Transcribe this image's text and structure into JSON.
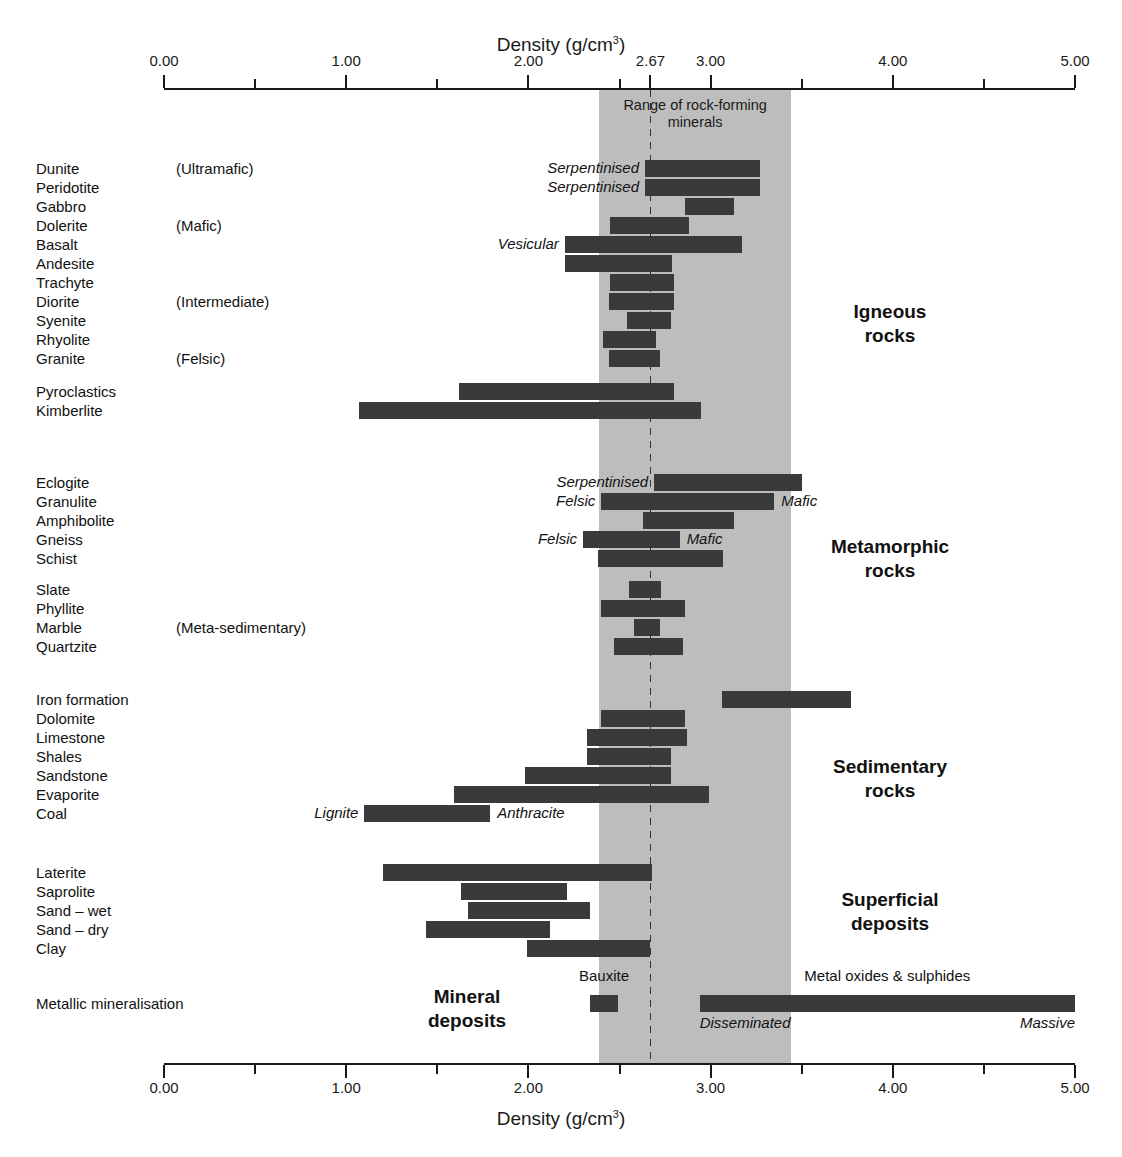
{
  "chart_data": {
    "type": "bar",
    "orientation": "horizontal-range",
    "title": "Density (g/cm3)",
    "xlabel": "Density (g/cm³)",
    "xlabel_top": "Density (g/cm³)",
    "xlabel_bottom": "Density (g/cm³)",
    "ylabel": "",
    "xlim": [
      0.0,
      5.0
    ],
    "xticks": [
      0.0,
      1.0,
      2.0,
      3.0,
      4.0,
      5.0
    ],
    "xticklabels": [
      "0.00",
      "1.00",
      "2.00",
      "3.00",
      "4.00",
      "5.00"
    ],
    "xticks_minor": [
      0.5,
      1.5,
      2.5,
      3.5,
      4.5
    ],
    "special_tick": {
      "value": 2.67,
      "label": "2.67"
    },
    "grid": false,
    "legend": false,
    "band": {
      "label": "Range of rock-forming\nminerals",
      "min": 2.39,
      "max": 3.44,
      "color": "#bdbdbd",
      "reference_line": 2.67
    },
    "categories": [
      "Dunite",
      "Peridotite",
      "Gabbro",
      "Dolerite",
      "Basalt",
      "Andesite",
      "Trachyte",
      "Diorite",
      "Syenite",
      "Rhyolite",
      "Granite",
      "Pyroclastics",
      "Kimberlite",
      "Eclogite",
      "Granulite",
      "Amphibolite",
      "Gneiss",
      "Schist",
      "Slate",
      "Phyllite",
      "Marble",
      "Quartzite",
      "Iron formation",
      "Dolomite",
      "Limestone",
      "Shales",
      "Sandstone",
      "Evaporite",
      "Coal",
      "Laterite",
      "Saprolite",
      "Sand – wet",
      "Sand – dry",
      "Clay",
      "Metallic mineralisation"
    ],
    "ranges": [
      [
        2.64,
        3.27
      ],
      [
        2.64,
        3.27
      ],
      [
        2.86,
        3.13
      ],
      [
        2.45,
        2.88
      ],
      [
        2.2,
        3.17
      ],
      [
        2.2,
        2.79
      ],
      [
        2.45,
        2.8
      ],
      [
        2.44,
        2.8
      ],
      [
        2.54,
        2.78
      ],
      [
        2.41,
        2.7
      ],
      [
        2.44,
        2.72
      ],
      [
        1.62,
        2.8
      ],
      [
        1.07,
        2.95
      ],
      [
        2.69,
        3.5
      ],
      [
        2.4,
        3.35
      ],
      [
        2.63,
        3.13
      ],
      [
        2.3,
        2.83
      ],
      [
        2.38,
        3.07
      ],
      [
        2.55,
        2.73
      ],
      [
        2.4,
        2.86
      ],
      [
        2.58,
        2.72
      ],
      [
        2.47,
        2.85
      ],
      [
        3.06,
        3.77
      ],
      [
        2.4,
        2.86
      ],
      [
        2.32,
        2.87
      ],
      [
        2.32,
        2.78
      ],
      [
        1.98,
        2.78
      ],
      [
        1.59,
        2.99
      ],
      [
        1.1,
        1.79
      ],
      [
        1.2,
        2.68
      ],
      [
        1.63,
        2.21
      ],
      [
        1.67,
        2.34
      ],
      [
        1.44,
        2.12
      ],
      [
        1.99,
        2.67
      ],
      [
        2.34,
        2.49
      ]
    ],
    "extra_ranges": [
      {
        "category": "Metallic mineralisation",
        "label": "Metal oxides & sulphides",
        "min": 2.94,
        "max": 5.0
      }
    ]
  },
  "rows": [
    {
      "name": "Dunite",
      "label": "Dunite",
      "group": "(Ultramafic)",
      "min": 2.64,
      "max": 3.27,
      "left_annot": "Serpentinised",
      "right_annot": ""
    },
    {
      "name": "Peridotite",
      "label": "Peridotite",
      "group": "",
      "min": 2.64,
      "max": 3.27,
      "left_annot": "Serpentinised",
      "right_annot": ""
    },
    {
      "name": "Gabbro",
      "label": "Gabbro",
      "group": "",
      "min": 2.86,
      "max": 3.13,
      "left_annot": "",
      "right_annot": ""
    },
    {
      "name": "Dolerite",
      "label": "Dolerite",
      "group": "(Mafic)",
      "min": 2.45,
      "max": 2.88,
      "left_annot": "",
      "right_annot": ""
    },
    {
      "name": "Basalt",
      "label": "Basalt",
      "group": "",
      "min": 2.2,
      "max": 3.17,
      "left_annot": "Vesicular",
      "right_annot": ""
    },
    {
      "name": "Andesite",
      "label": "Andesite",
      "group": "",
      "min": 2.2,
      "max": 2.79,
      "left_annot": "",
      "right_annot": ""
    },
    {
      "name": "Trachyte",
      "label": "Trachyte",
      "group": "",
      "min": 2.45,
      "max": 2.8,
      "left_annot": "",
      "right_annot": ""
    },
    {
      "name": "Diorite",
      "label": "Diorite",
      "group": "(Intermediate)",
      "min": 2.44,
      "max": 2.8,
      "left_annot": "",
      "right_annot": ""
    },
    {
      "name": "Syenite",
      "label": "Syenite",
      "group": "",
      "min": 2.54,
      "max": 2.78,
      "left_annot": "",
      "right_annot": ""
    },
    {
      "name": "Rhyolite",
      "label": "Rhyolite",
      "group": "",
      "min": 2.41,
      "max": 2.7,
      "left_annot": "",
      "right_annot": ""
    },
    {
      "name": "Granite",
      "label": "Granite",
      "group": "(Felsic)",
      "min": 2.44,
      "max": 2.72,
      "left_annot": "",
      "right_annot": ""
    },
    {
      "name": "Pyroclastics",
      "label": "Pyroclastics",
      "group": "",
      "min": 1.62,
      "max": 2.8,
      "left_annot": "",
      "right_annot": ""
    },
    {
      "name": "Kimberlite",
      "label": "Kimberlite",
      "group": "",
      "min": 1.07,
      "max": 2.95,
      "left_annot": "",
      "right_annot": ""
    },
    {
      "name": "Eclogite",
      "label": "Eclogite",
      "group": "",
      "min": 2.69,
      "max": 3.5,
      "left_annot": "Serpentinised",
      "right_annot": ""
    },
    {
      "name": "Granulite",
      "label": "Granulite",
      "group": "",
      "min": 2.4,
      "max": 3.35,
      "left_annot": "Felsic",
      "right_annot": "Mafic"
    },
    {
      "name": "Amphibolite",
      "label": "Amphibolite",
      "group": "",
      "min": 2.63,
      "max": 3.13,
      "left_annot": "",
      "right_annot": ""
    },
    {
      "name": "Gneiss",
      "label": "Gneiss",
      "group": "",
      "min": 2.3,
      "max": 2.83,
      "left_annot": "Felsic",
      "right_annot": "Mafic"
    },
    {
      "name": "Schist",
      "label": "Schist",
      "group": "",
      "min": 2.38,
      "max": 3.07,
      "left_annot": "",
      "right_annot": ""
    },
    {
      "name": "Slate",
      "label": "Slate",
      "group": "",
      "min": 2.55,
      "max": 2.73,
      "left_annot": "",
      "right_annot": ""
    },
    {
      "name": "Phyllite",
      "label": "Phyllite",
      "group": "",
      "min": 2.4,
      "max": 2.86,
      "left_annot": "",
      "right_annot": ""
    },
    {
      "name": "Marble",
      "label": "Marble",
      "group": "(Meta-sedimentary)",
      "min": 2.58,
      "max": 2.72,
      "left_annot": "",
      "right_annot": ""
    },
    {
      "name": "Quartzite",
      "label": "Quartzite",
      "group": "",
      "min": 2.47,
      "max": 2.85,
      "left_annot": "",
      "right_annot": ""
    },
    {
      "name": "Iron formation",
      "label": "Iron formation",
      "group": "",
      "min": 3.06,
      "max": 3.77,
      "left_annot": "",
      "right_annot": ""
    },
    {
      "name": "Dolomite",
      "label": "Dolomite",
      "group": "",
      "min": 2.4,
      "max": 2.86,
      "left_annot": "",
      "right_annot": ""
    },
    {
      "name": "Limestone",
      "label": "Limestone",
      "group": "",
      "min": 2.32,
      "max": 2.87,
      "left_annot": "",
      "right_annot": ""
    },
    {
      "name": "Shales",
      "label": "Shales",
      "group": "",
      "min": 2.32,
      "max": 2.78,
      "left_annot": "",
      "right_annot": ""
    },
    {
      "name": "Sandstone",
      "label": "Sandstone",
      "group": "",
      "min": 1.98,
      "max": 2.78,
      "left_annot": "",
      "right_annot": ""
    },
    {
      "name": "Evaporite",
      "label": "Evaporite",
      "group": "",
      "min": 1.59,
      "max": 2.99,
      "left_annot": "",
      "right_annot": ""
    },
    {
      "name": "Coal",
      "label": "Coal",
      "group": "",
      "min": 1.1,
      "max": 1.79,
      "left_annot": "Lignite",
      "right_annot": "Anthracite"
    },
    {
      "name": "Laterite",
      "label": "Laterite",
      "group": "",
      "min": 1.2,
      "max": 2.68,
      "left_annot": "",
      "right_annot": ""
    },
    {
      "name": "Saprolite",
      "label": "Saprolite",
      "group": "",
      "min": 1.63,
      "max": 2.21,
      "left_annot": "",
      "right_annot": ""
    },
    {
      "name": "Sand-wet",
      "label": "Sand – wet",
      "group": "",
      "min": 1.67,
      "max": 2.34,
      "left_annot": "",
      "right_annot": ""
    },
    {
      "name": "Sand-dry",
      "label": "Sand – dry",
      "group": "",
      "min": 1.44,
      "max": 2.12,
      "left_annot": "",
      "right_annot": ""
    },
    {
      "name": "Clay",
      "label": "Clay",
      "group": "",
      "min": 1.99,
      "max": 2.67,
      "left_annot": "",
      "right_annot": ""
    }
  ],
  "metallic": {
    "label": "Metallic mineralisation",
    "bauxite": {
      "label": "Bauxite",
      "min": 2.34,
      "max": 2.49
    },
    "oxides": {
      "label": "Metal oxides & sulphides",
      "min": 2.94,
      "max": 5.0,
      "left_annot": "Disseminated",
      "right_annot": "Massive"
    }
  },
  "class_labels": [
    {
      "name": "igneous",
      "text": "Igneous\nrocks"
    },
    {
      "name": "metamorphic",
      "text": "Metamorphic\nrocks"
    },
    {
      "name": "sedimentary",
      "text": "Sedimentary\nrocks"
    },
    {
      "name": "superficial",
      "text": "Superficial\ndeposits"
    },
    {
      "name": "mineral",
      "text": "Mineral\ndeposits"
    }
  ],
  "colors": {
    "bar": "#3a3a3a",
    "band": "#bdbdbd",
    "axis": "#1a1a1a",
    "text": "#111111"
  }
}
